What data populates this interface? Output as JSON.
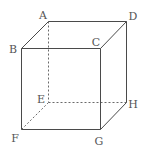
{
  "diagram": {
    "type": "cube",
    "vertices": {
      "A": {
        "x": 48,
        "y": 21,
        "label": "A",
        "label_x": 43,
        "label_y": 15
      },
      "B": {
        "x": 21,
        "y": 48,
        "label": "B",
        "label_x": 13,
        "label_y": 49
      },
      "C": {
        "x": 100,
        "y": 48,
        "label": "C",
        "label_x": 96,
        "label_y": 42
      },
      "D": {
        "x": 126,
        "y": 21,
        "label": "D",
        "label_x": 133,
        "label_y": 16
      },
      "E": {
        "x": 48,
        "y": 102,
        "label": "E",
        "label_x": 41,
        "label_y": 99
      },
      "F": {
        "x": 21,
        "y": 129,
        "label": "F",
        "label_x": 15,
        "label_y": 138
      },
      "G": {
        "x": 100,
        "y": 129,
        "label": "G",
        "label_x": 99,
        "label_y": 141
      },
      "H": {
        "x": 126,
        "y": 102,
        "label": "H",
        "label_x": 133,
        "label_y": 104
      }
    },
    "visible_edges": [
      [
        "A",
        "B"
      ],
      [
        "A",
        "D"
      ],
      [
        "B",
        "C"
      ],
      [
        "C",
        "D"
      ],
      [
        "B",
        "F"
      ],
      [
        "C",
        "G"
      ],
      [
        "D",
        "H"
      ],
      [
        "F",
        "G"
      ],
      [
        "G",
        "H"
      ]
    ],
    "hidden_edges": [
      [
        "A",
        "E"
      ],
      [
        "E",
        "F"
      ],
      [
        "E",
        "H"
      ]
    ],
    "colors": {
      "edge": "#4a4a4a",
      "hidden_edge": "#6a6a6a",
      "label": "#555555"
    }
  }
}
